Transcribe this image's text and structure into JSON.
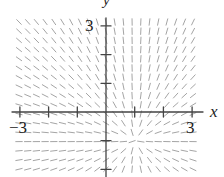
{
  "figure": {
    "type": "slope_field",
    "axis_labels": {
      "x": "x",
      "y": "y"
    },
    "tick_labels": {
      "y_top": "3",
      "x_left": "−3",
      "x_right": "3"
    },
    "x_range": [
      -3,
      3
    ],
    "y_range": [
      -3,
      3
    ],
    "tick_step": 1,
    "field_center": [
      1,
      -1
    ],
    "field_description": "segments radiate from point (1,-1): slope = (y+1)/(x-1)",
    "colors": {
      "axis": "#444444",
      "segment": "#9a9a9a",
      "text": "#222222"
    }
  },
  "layout": {
    "origin_px": [
      106,
      112
    ],
    "unit_px": 28.7,
    "grid_cols": 21,
    "grid_rows": 17,
    "grid_x0": 19,
    "grid_y0": 22,
    "grid_dx": 8.7,
    "grid_dy": 9.2,
    "seg_len": 6.5
  }
}
